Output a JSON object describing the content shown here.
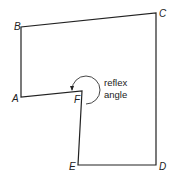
{
  "diagram": {
    "type": "polygon",
    "vertices": [
      {
        "id": "A",
        "label": "A",
        "x": 21,
        "y": 97,
        "lx": 12,
        "ly": 102
      },
      {
        "id": "B",
        "label": "B",
        "x": 21,
        "y": 27,
        "lx": 14,
        "ly": 30
      },
      {
        "id": "C",
        "label": "C",
        "x": 156,
        "y": 13,
        "lx": 159,
        "ly": 17
      },
      {
        "id": "D",
        "label": "D",
        "x": 156,
        "y": 165,
        "lx": 159,
        "ly": 170
      },
      {
        "id": "E",
        "label": "E",
        "x": 78,
        "y": 165,
        "lx": 69,
        "ly": 170
      },
      {
        "id": "F",
        "label": "F",
        "x": 82,
        "y": 91,
        "lx": 74,
        "ly": 103
      }
    ],
    "edges": [
      [
        "A",
        "B"
      ],
      [
        "B",
        "C"
      ],
      [
        "C",
        "D"
      ],
      [
        "D",
        "E"
      ],
      [
        "E",
        "F"
      ],
      [
        "F",
        "A"
      ]
    ],
    "annotation": {
      "line1": "reflex",
      "line2": "angle",
      "vertex": "F"
    },
    "colors": {
      "stroke": "#222222",
      "text": "#222222",
      "background": "#ffffff"
    }
  }
}
